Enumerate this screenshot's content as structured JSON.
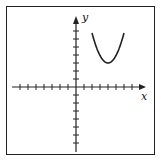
{
  "figure": {
    "axes": {
      "x_label": "x",
      "y_label": "y",
      "x_ticks_range": [
        -8,
        8
      ],
      "y_ticks_range": [
        -8,
        8
      ],
      "tick_spacing_px": 8
    },
    "curve": {
      "type": "parabola",
      "opens": "up",
      "vertex": [
        4,
        3
      ],
      "x_domain": [
        2,
        6
      ],
      "description": "upward-opening parabola in first quadrant"
    }
  },
  "colors": {
    "stroke": "#222222",
    "background": "#ffffff"
  }
}
